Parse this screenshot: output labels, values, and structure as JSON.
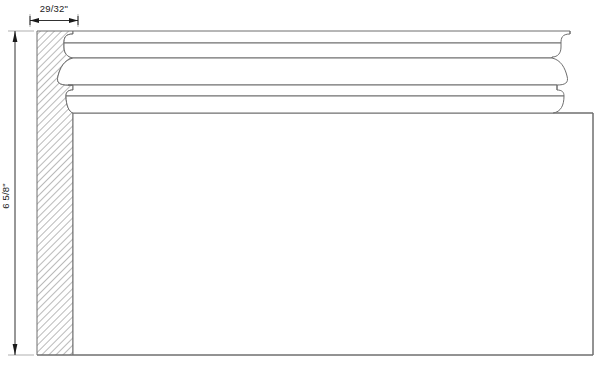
{
  "drawing": {
    "title": "Molding Profile Section",
    "type": "technical-section-drawing",
    "background_color": "#ffffff",
    "line_color": "#6e6e6e",
    "dimension_color": "#1a1a1a",
    "hatch_color": "#777777"
  },
  "dimensions": {
    "width": {
      "label": "29/32\"",
      "name": "profile-thickness",
      "orientation": "horizontal",
      "value_inches": 0.90625
    },
    "height": {
      "label": "6 5/8\"",
      "name": "profile-height",
      "orientation": "vertical",
      "value_inches": 6.625
    }
  },
  "geometry": {
    "section_band": {
      "name": "hatched-cross-section",
      "x_left": 37,
      "x_right": 73,
      "y_top": 31,
      "y_bottom": 355,
      "hatch_angle_deg": 45
    },
    "body": {
      "name": "molding-body",
      "x_left": 73,
      "x_right": 593,
      "y_top": 113,
      "y_bottom": 355
    },
    "profile_bands": [
      {
        "name": "top-fillet",
        "y_top": 31,
        "y_bottom": 43
      },
      {
        "name": "upper-bead",
        "y_top": 43,
        "y_bottom": 58
      },
      {
        "name": "large-cove",
        "y_top": 58,
        "y_bottom": 85
      },
      {
        "name": "mid-fillet",
        "y_top": 85,
        "y_bottom": 94
      },
      {
        "name": "lower-bead",
        "y_top": 94,
        "y_bottom": 113
      }
    ],
    "end_caps": {
      "name": "right-end-rounded-returns",
      "x_start": 540,
      "x_end": 593
    }
  }
}
